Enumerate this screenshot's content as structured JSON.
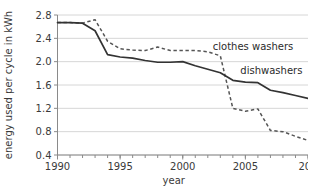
{
  "chart_data": {
    "type": "line",
    "title": "",
    "xlabel": "year",
    "ylabel": "energy used per cycle in kWh",
    "xlim": [
      1990,
      2010
    ],
    "ylim": [
      0.4,
      2.8
    ],
    "grid": "horizontal",
    "legend_position": "inline-annotations",
    "x": [
      1990,
      1991,
      1992,
      1993,
      1994,
      1995,
      1996,
      1997,
      1998,
      1999,
      2000,
      2001,
      2002,
      2003,
      2004,
      2005,
      2006,
      2007,
      2008,
      2009,
      2010
    ],
    "y_ticks": [
      "0.4",
      "0.8",
      "1.2",
      "1.6",
      "2.0",
      "2.4",
      "2.8"
    ],
    "x_ticks": [
      "1990",
      "1995",
      "2000",
      "2005",
      "201"
    ],
    "x_tick_values": [
      1990,
      1995,
      2000,
      2005,
      2010
    ],
    "series": [
      {
        "name": "dishwashers",
        "style": "solid",
        "color": "#333333",
        "label": "dishwashers",
        "values": [
          2.67,
          2.67,
          2.66,
          2.53,
          2.12,
          2.08,
          2.06,
          2.02,
          1.99,
          1.99,
          2.0,
          1.93,
          1.87,
          1.81,
          1.68,
          1.65,
          1.64,
          1.51,
          1.47,
          1.42,
          1.37
        ]
      },
      {
        "name": "clothes washers",
        "style": "dashed",
        "color": "#555555",
        "label": "clothes washers",
        "values": [
          2.67,
          2.67,
          2.66,
          2.72,
          2.35,
          2.22,
          2.2,
          2.19,
          2.25,
          2.19,
          2.19,
          2.19,
          2.17,
          2.1,
          1.2,
          1.15,
          1.19,
          0.82,
          0.8,
          0.72,
          0.65
        ]
      }
    ],
    "annotations": [
      {
        "text": "clothes washers",
        "x": 2002.4,
        "y": 2.22
      },
      {
        "text": "dishwashers",
        "x": 2004.6,
        "y": 1.8
      }
    ]
  }
}
